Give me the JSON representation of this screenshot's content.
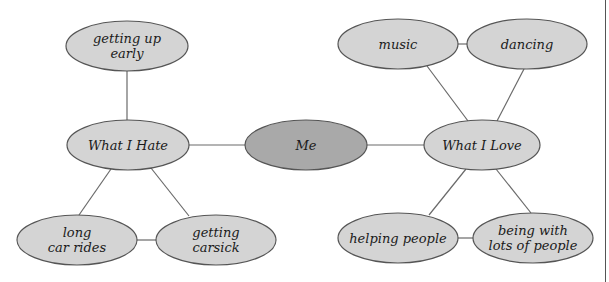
{
  "diagram": {
    "type": "concept-map",
    "center": {
      "id": "me",
      "label": "Me",
      "cx": 306,
      "cy": 145,
      "rx": 61,
      "ry": 25
    },
    "branches": [
      {
        "id": "what-i-hate",
        "label": "What I Hate",
        "cx": 128,
        "cy": 145,
        "rx": 61,
        "ry": 25,
        "children": [
          {
            "id": "getting-up-early",
            "label": "getting up\nearly",
            "cx": 127,
            "cy": 46,
            "rx": 61,
            "ry": 25
          },
          {
            "id": "long-car-rides",
            "label": "long\ncar rides",
            "cx": 77,
            "cy": 240,
            "rx": 60,
            "ry": 25
          },
          {
            "id": "getting-carsick",
            "label": "getting\ncarsick",
            "cx": 216,
            "cy": 240,
            "rx": 60,
            "ry": 25
          }
        ]
      },
      {
        "id": "what-i-love",
        "label": "What I Love",
        "cx": 482,
        "cy": 145,
        "rx": 58,
        "ry": 25,
        "children": [
          {
            "id": "music",
            "label": "music",
            "cx": 398,
            "cy": 44,
            "rx": 60,
            "ry": 25
          },
          {
            "id": "dancing",
            "label": "dancing",
            "cx": 527,
            "cy": 44,
            "rx": 60,
            "ry": 25
          },
          {
            "id": "helping-people",
            "label": "helping people",
            "cx": 398,
            "cy": 238,
            "rx": 60,
            "ry": 25
          },
          {
            "id": "being-with-lots-of-people",
            "label": "being with\nlots of people",
            "cx": 533,
            "cy": 238,
            "rx": 60,
            "ry": 25
          }
        ]
      }
    ],
    "edges": [
      {
        "from": "what-i-hate",
        "to": "me",
        "x1": 189,
        "y1": 145,
        "x2": 245,
        "y2": 145
      },
      {
        "from": "me",
        "to": "what-i-love",
        "x1": 367,
        "y1": 145,
        "x2": 424,
        "y2": 145
      },
      {
        "from": "getting-up-early",
        "to": "what-i-hate",
        "x1": 127,
        "y1": 71,
        "x2": 127,
        "y2": 120
      },
      {
        "from": "what-i-hate",
        "to": "long-car-rides",
        "x1": 111,
        "y1": 169,
        "x2": 79,
        "y2": 215
      },
      {
        "from": "what-i-hate",
        "to": "getting-carsick",
        "x1": 151,
        "y1": 168,
        "x2": 189,
        "y2": 216
      },
      {
        "from": "long-car-rides",
        "to": "getting-carsick",
        "x1": 137,
        "y1": 240,
        "x2": 156,
        "y2": 240
      },
      {
        "from": "music",
        "to": "dancing",
        "x1": 458,
        "y1": 44,
        "x2": 467,
        "y2": 44
      },
      {
        "from": "music",
        "to": "what-i-love",
        "x1": 427,
        "y1": 66,
        "x2": 468,
        "y2": 121
      },
      {
        "from": "dancing",
        "to": "what-i-love",
        "x1": 524,
        "y1": 69,
        "x2": 497,
        "y2": 121
      },
      {
        "from": "what-i-love",
        "to": "helping-people",
        "x1": 466,
        "y1": 169,
        "x2": 429,
        "y2": 215
      },
      {
        "from": "what-i-love",
        "to": "being-with-lots-of-people",
        "x1": 496,
        "y1": 169,
        "x2": 531,
        "y2": 213
      },
      {
        "from": "helping-people",
        "to": "being-with-lots-of-people",
        "x1": 458,
        "y1": 238,
        "x2": 473,
        "y2": 238
      }
    ],
    "colors": {
      "node_fill": "#d4d4d4",
      "center_fill": "#a9a9a9",
      "stroke": "#555555",
      "edge": "#6a6a6a",
      "text": "#1a1a1a"
    }
  }
}
